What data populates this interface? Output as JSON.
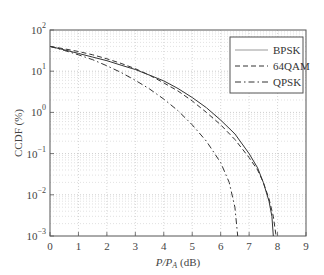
{
  "chart_data": {
    "type": "line",
    "title": "",
    "xlabel": "P/P_A (dB)",
    "xlabel_parts": {
      "main": "P/P",
      "sub": "A",
      "unit": " (dB)"
    },
    "ylabel": "CCDF (%)",
    "xlim": [
      0,
      9
    ],
    "ylim": [
      0.001,
      100
    ],
    "yscale": "log",
    "grid": true,
    "legend_position": "upper right",
    "x_ticks": [
      "0",
      "1",
      "2",
      "3",
      "4",
      "5",
      "6",
      "7",
      "8",
      "9"
    ],
    "y_ticks": [
      {
        "base": "10",
        "exp": "2"
      },
      {
        "base": "10",
        "exp": "1"
      },
      {
        "base": "10",
        "exp": "0"
      },
      {
        "base": "10",
        "exp": "−1"
      },
      {
        "base": "10",
        "exp": "−2"
      },
      {
        "base": "10",
        "exp": "−3"
      }
    ],
    "series": [
      {
        "name": "BPSK",
        "style": "solid",
        "x": [
          0,
          0.5,
          1,
          1.5,
          2,
          2.5,
          3,
          3.5,
          4,
          4.5,
          5,
          5.5,
          6,
          6.5,
          7,
          7.3,
          7.5,
          7.7,
          7.8,
          7.85
        ],
        "y": [
          40,
          33,
          27,
          22,
          18,
          14,
          11,
          8,
          5.8,
          3.8,
          2.3,
          1.3,
          0.65,
          0.3,
          0.1,
          0.045,
          0.02,
          0.007,
          0.003,
          0.001
        ]
      },
      {
        "name": "64QAM",
        "style": "dashed",
        "x": [
          0,
          0.5,
          1,
          1.5,
          2,
          2.5,
          3,
          3.5,
          4,
          4.5,
          5,
          5.5,
          6,
          6.5,
          7,
          7.3,
          7.5,
          7.7,
          7.85,
          7.95
        ],
        "y": [
          40,
          35,
          30,
          25,
          20,
          15.5,
          11.5,
          8,
          5.2,
          3.3,
          1.9,
          1.0,
          0.5,
          0.22,
          0.08,
          0.04,
          0.02,
          0.008,
          0.003,
          0.001
        ]
      },
      {
        "name": "QPSK",
        "style": "dash-dot",
        "x": [
          0,
          0.5,
          1,
          1.5,
          2,
          2.5,
          3,
          3.5,
          4,
          4.5,
          5,
          5.5,
          6,
          6.3,
          6.5,
          6.6
        ],
        "y": [
          40,
          32,
          25,
          19,
          13.5,
          9.3,
          6,
          3.7,
          2.1,
          1.1,
          0.5,
          0.2,
          0.06,
          0.02,
          0.005,
          0.001
        ]
      }
    ]
  }
}
